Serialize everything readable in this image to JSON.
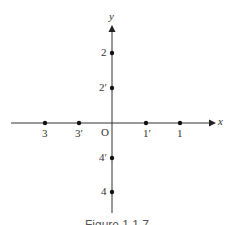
{
  "diagram": {
    "type": "coordinate-axes",
    "x_axis_label": "x",
    "y_axis_label": "y",
    "origin_label": "O",
    "x_points": [
      {
        "label": "3",
        "side": "negative"
      },
      {
        "label": "3′",
        "side": "negative"
      },
      {
        "label": "1′",
        "side": "positive"
      },
      {
        "label": "1",
        "side": "positive"
      }
    ],
    "y_points": [
      {
        "label": "2",
        "side": "positive"
      },
      {
        "label": "2′",
        "side": "positive"
      },
      {
        "label": "4′",
        "side": "negative"
      },
      {
        "label": "4",
        "side": "negative"
      }
    ],
    "caption": "Figure 1.1.7"
  }
}
